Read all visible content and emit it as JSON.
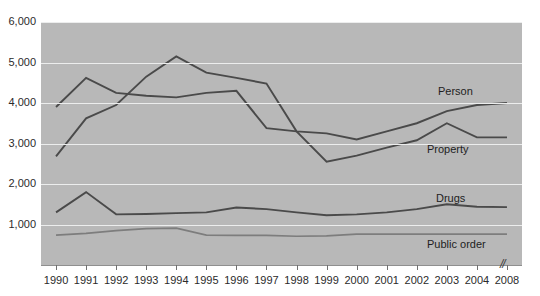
{
  "figure": {
    "title_remnant": "..............",
    "background_color": "#b8b8b8",
    "gridline_color": "#eceded",
    "line_color": "#4a4a4a",
    "light_line_color": "#7d7d7d",
    "axis_break_symbol": "//"
  },
  "axes": {
    "y_ticks": [
      "6,000",
      "5,000",
      "4,000",
      "3,000",
      "2,000",
      "1,000"
    ],
    "x_ticks": [
      "1990",
      "1991",
      "1992",
      "1993",
      "1994",
      "1995",
      "1996",
      "1997",
      "1998",
      "1999",
      "2000",
      "2001",
      "2002",
      "2003",
      "2004",
      "2008"
    ]
  },
  "series_labels": {
    "person": "Person",
    "property": "Property",
    "drugs": "Drugs",
    "public_order": "Public order"
  },
  "chart_data": {
    "type": "line",
    "title": "",
    "xlabel": "",
    "ylabel": "",
    "grid": true,
    "legend": "inline-right",
    "xlim": [
      1990,
      2008
    ],
    "ylim": [
      0,
      6000
    ],
    "y_ticks": [
      1000,
      2000,
      3000,
      4000,
      5000,
      6000
    ],
    "x": [
      1990,
      1991,
      1992,
      1993,
      1994,
      1995,
      1996,
      1997,
      1998,
      1999,
      2000,
      2001,
      2002,
      2003,
      2004,
      2008
    ],
    "axis_break_between": [
      2004,
      2008
    ],
    "series": [
      {
        "name": "Person",
        "values": [
          3900,
          4620,
          4250,
          4180,
          4140,
          4250,
          4300,
          3380,
          3300,
          3250,
          3100,
          3300,
          3500,
          3800,
          3950,
          4000
        ]
      },
      {
        "name": "Property",
        "values": [
          2680,
          3620,
          3950,
          4650,
          5150,
          4750,
          4620,
          4480,
          3300,
          2550,
          2700,
          2900,
          3080,
          3500,
          3150,
          3150
        ]
      },
      {
        "name": "Drugs",
        "values": [
          1300,
          1800,
          1250,
          1260,
          1280,
          1300,
          1420,
          1380,
          1300,
          1230,
          1250,
          1300,
          1380,
          1500,
          1440,
          1430
        ]
      },
      {
        "name": "Public order",
        "values": [
          740,
          780,
          850,
          900,
          910,
          740,
          730,
          730,
          710,
          720,
          760,
          760,
          760,
          760,
          760,
          760
        ]
      }
    ]
  }
}
